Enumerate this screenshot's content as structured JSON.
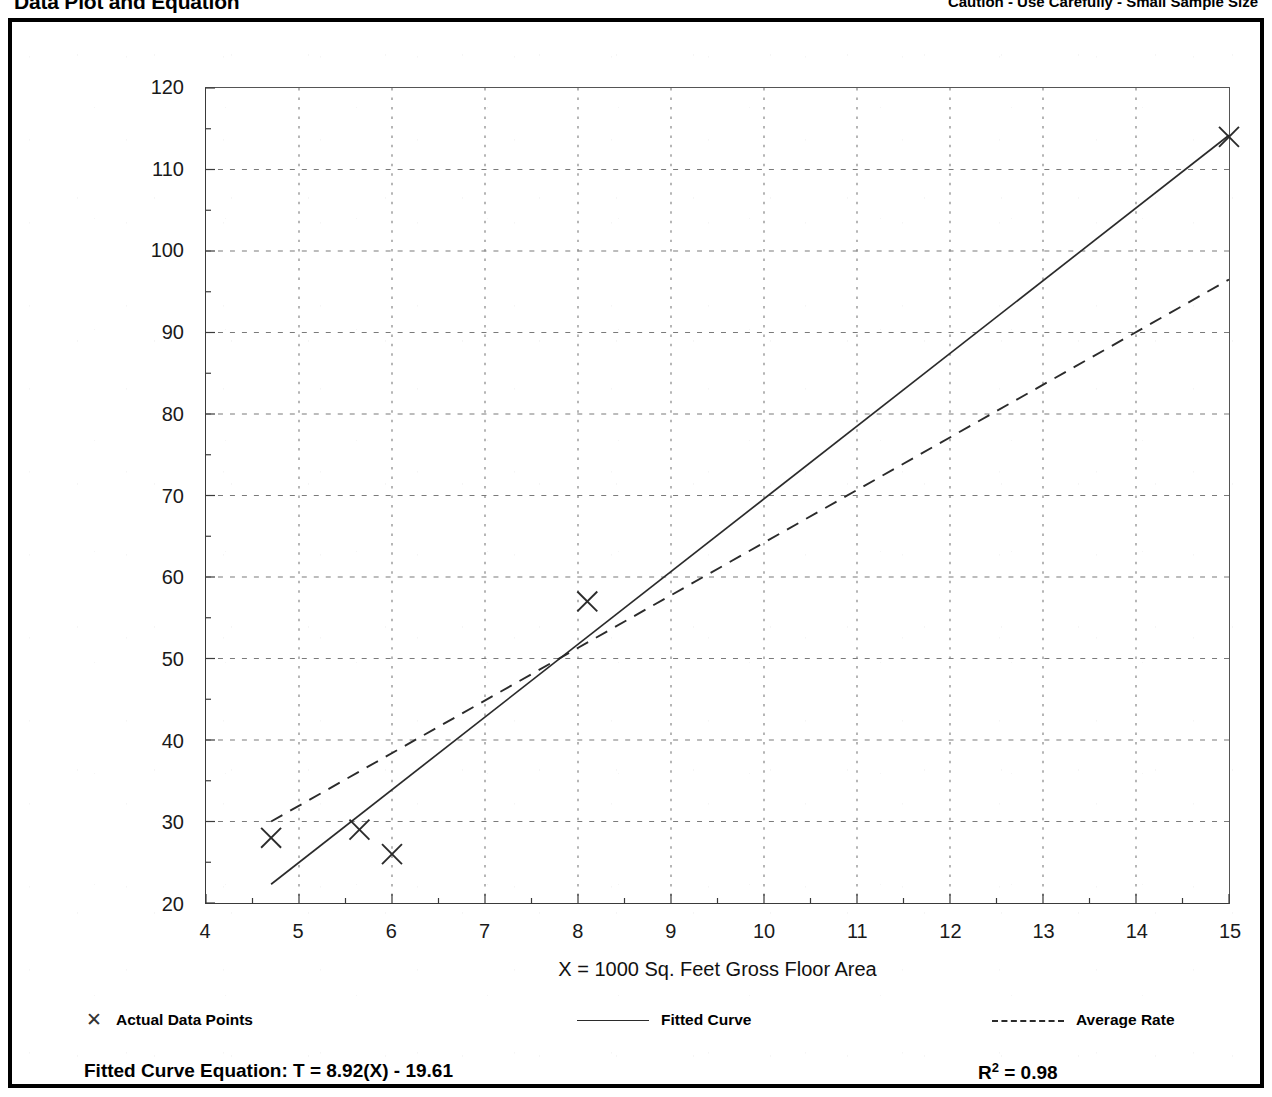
{
  "header": {
    "left_title": "Data Plot and Equation",
    "right_note": "Caution - Use Carefully - Small Sample Size"
  },
  "axis_titles": {
    "x": "X = 1000 Sq. Feet Gross Floor Area",
    "y": "T = Average Vehicle Trip Ends"
  },
  "legend": {
    "entries": [
      {
        "label": "Actual Data Points",
        "swatch": "marker-x",
        "glyph": "✕"
      },
      {
        "label": "Fitted Curve",
        "swatch": "solid-line",
        "glyph": ""
      },
      {
        "label": "Average Rate",
        "swatch": "dashed-line",
        "glyph": ""
      }
    ]
  },
  "equation": {
    "fitted_label": "Fitted Curve Equation:  T = 8.92(X) - 19.61",
    "r_squared_symbol": "R",
    "r_squared_exp": "2",
    "r_squared_value": " = 0.98"
  },
  "chart_data": {
    "type": "scatter",
    "title": "Data Plot and Equation",
    "xlabel": "X = 1000 Sq. Feet Gross Floor Area",
    "ylabel": "T = Average Vehicle Trip Ends",
    "xlim": [
      4,
      15
    ],
    "ylim": [
      20,
      120
    ],
    "xticks": [
      4,
      5,
      6,
      7,
      8,
      9,
      10,
      11,
      12,
      13,
      14,
      15
    ],
    "xtick_labels": [
      "4",
      "5",
      "6",
      "7",
      "8",
      "9",
      "10",
      "11",
      "12",
      "13",
      "14",
      "15"
    ],
    "yticks": [
      20,
      30,
      40,
      50,
      60,
      70,
      80,
      90,
      100,
      110,
      120
    ],
    "ytick_labels": [
      "20",
      "30",
      "40",
      "50",
      "60",
      "70",
      "80",
      "90",
      "100",
      "110",
      "120"
    ],
    "x_minor_step": 0.5,
    "y_minor_step": 5,
    "grid": true,
    "grid_style": "dotted",
    "legend_position": "below-plot",
    "series": [
      {
        "name": "Actual Data Points",
        "type": "scatter",
        "marker": "x",
        "points": [
          {
            "x": 4.7,
            "y": 28
          },
          {
            "x": 5.65,
            "y": 29
          },
          {
            "x": 6.0,
            "y": 26
          },
          {
            "x": 8.1,
            "y": 57
          },
          {
            "x": 15.0,
            "y": 114
          }
        ]
      },
      {
        "name": "Fitted Curve",
        "type": "line",
        "style": "solid",
        "equation": "T = 8.92(X) - 19.61",
        "slope": 8.92,
        "intercept": -19.61,
        "r_squared": 0.98,
        "endpoints": [
          {
            "x": 4.7,
            "y": 22.3
          },
          {
            "x": 15.0,
            "y": 114.2
          }
        ]
      },
      {
        "name": "Average Rate",
        "type": "line",
        "style": "dashed",
        "endpoints": [
          {
            "x": 4.7,
            "y": 30.0
          },
          {
            "x": 15.0,
            "y": 96.5
          }
        ]
      }
    ]
  }
}
